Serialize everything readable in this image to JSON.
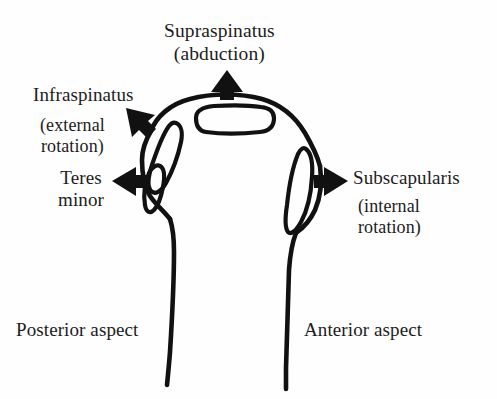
{
  "figure": {
    "background_color": "#fefefe",
    "ink_color": "#111111"
  },
  "labels": {
    "supraspinatus": {
      "name": "Supraspinatus",
      "action": "(abduction)"
    },
    "infraspinatus": {
      "name": "Infraspinatus",
      "action_line1": "(external",
      "action_line2": "rotation)"
    },
    "teres_minor": {
      "line1": "Teres",
      "line2": "minor"
    },
    "subscapularis": {
      "name": "Subscapularis",
      "action_line1": "(internal",
      "action_line2": "rotation)"
    },
    "posterior_aspect": "Posterior aspect",
    "anterior_aspect": "Anterior aspect"
  },
  "arrows": [
    {
      "id": "supraspinatus-arrow",
      "direction": "up",
      "points_to": "superior facet (greater tuberosity)"
    },
    {
      "id": "infraspinatus-arrow",
      "direction": "up-left",
      "points_to": "middle facet (greater tuberosity)"
    },
    {
      "id": "teres-minor-arrow",
      "direction": "left",
      "points_to": "inferior facet (greater tuberosity)"
    },
    {
      "id": "subscapularis-arrow",
      "direction": "right",
      "points_to": "lesser tuberosity"
    }
  ],
  "anatomy": {
    "bone": "proximal humerus",
    "facets": [
      "supraspinatus insertion (superior)",
      "infraspinatus insertion (posterior-superior)",
      "teres minor insertion (posterior-inferior)",
      "subscapularis insertion (anterior)"
    ]
  }
}
